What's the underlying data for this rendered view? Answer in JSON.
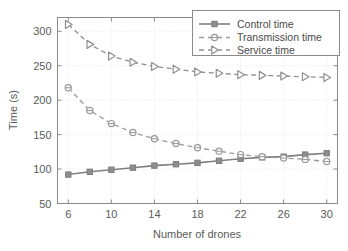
{
  "chart_data": {
    "type": "line",
    "title": "",
    "xlabel": "Number of drones",
    "ylabel": "Time (s)",
    "xlim": [
      5,
      31
    ],
    "ylim": [
      50,
      320
    ],
    "xticks": [
      6,
      10,
      14,
      18,
      22,
      26,
      30
    ],
    "yticks": [
      50,
      100,
      150,
      200,
      250,
      300
    ],
    "xtick_labels": [
      "6",
      "10",
      "14",
      "18",
      "22",
      "26",
      "30"
    ],
    "ytick_labels": [
      "50",
      "100",
      "150",
      "200",
      "250",
      "300"
    ],
    "grid": true,
    "legend_position": "top-right",
    "x": [
      6,
      8,
      10,
      12,
      14,
      16,
      18,
      20,
      22,
      24,
      26,
      28,
      30
    ],
    "series": [
      {
        "name": "Control time",
        "marker": "square-filled",
        "line_style": "solid",
        "color": "#808080",
        "values": [
          92,
          96,
          99,
          102,
          105,
          107,
          109,
          112,
          115,
          117,
          118,
          121,
          123
        ]
      },
      {
        "name": "Transmission time",
        "marker": "circle-open",
        "line_style": "dashed",
        "color": "#9a9a9a",
        "values": [
          218,
          185,
          166,
          153,
          144,
          137,
          131,
          126,
          121,
          118,
          116,
          114,
          111
        ]
      },
      {
        "name": "Service time",
        "marker": "triangle-right-open",
        "line_style": "dashed",
        "color": "#909090",
        "values": [
          310,
          281,
          264,
          255,
          249,
          245,
          241,
          239,
          237,
          236,
          235,
          234,
          233
        ]
      }
    ]
  },
  "legend": {
    "entries": [
      {
        "label": "Control time"
      },
      {
        "label": "Transmission time"
      },
      {
        "label": "Service time"
      }
    ]
  }
}
